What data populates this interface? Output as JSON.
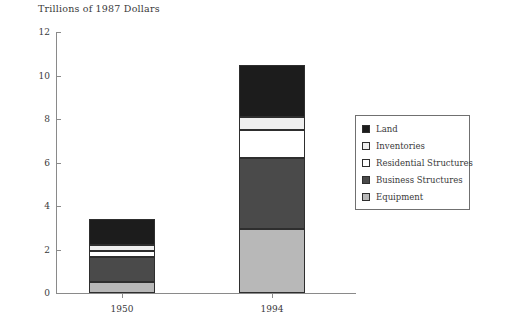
{
  "chart_data": {
    "type": "bar",
    "subtype": "stacked-vertical",
    "title": "Trillions of 1987 Dollars",
    "xlabel": "",
    "ylabel": "",
    "ylim": [
      0,
      12
    ],
    "yticks": [
      0,
      2,
      4,
      6,
      8,
      10,
      12
    ],
    "ytick_labels": [
      "0",
      "2",
      "4",
      "6",
      "8",
      "10",
      "12"
    ],
    "grid": false,
    "categories": [
      "1950",
      "1994"
    ],
    "series": [
      {
        "name": "Equipment",
        "values": [
          0.5,
          2.95
        ],
        "color": "#b8b8b8"
      },
      {
        "name": "Business Structures",
        "values": [
          1.15,
          3.25
        ],
        "color": "#4a4a4a"
      },
      {
        "name": "Residential Structures",
        "values": [
          0.3,
          1.3
        ],
        "color": "#ffffff"
      },
      {
        "name": "Inventories",
        "values": [
          0.25,
          0.6
        ],
        "color": "#efefef"
      },
      {
        "name": "Land",
        "values": [
          1.2,
          2.4
        ],
        "color": "#1c1c1c"
      }
    ],
    "stack_order_bottom_to_top": [
      "Equipment",
      "Business Structures",
      "Residential Structures",
      "Inventories",
      "Land"
    ],
    "totals": [
      3.4,
      10.5
    ],
    "legend": {
      "position": "right",
      "entries": [
        {
          "label": "Land",
          "color": "#1c1c1c"
        },
        {
          "label": "Inventories",
          "color": "#efefef"
        },
        {
          "label": "Residential Structures",
          "color": "#ffffff"
        },
        {
          "label": "Business Structures",
          "color": "#4a4a4a"
        },
        {
          "label": "Equipment",
          "color": "#b8b8b8"
        }
      ]
    }
  },
  "axis_colors": {
    "line": "#8a8a8a",
    "bar_outline": "#2e2e2e",
    "text": "#3a3a3a"
  }
}
